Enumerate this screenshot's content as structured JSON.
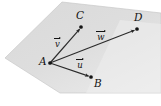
{
  "figure": {
    "kind": "vector-diagram-in-plane",
    "canvas": {
      "width": 106,
      "height": 106
    },
    "colors": {
      "plane_fill": "#dcdcdc",
      "plane_fill_light": "#e9e9e9",
      "plane_stroke": "#c4c4c4",
      "arrow": "#262626",
      "label": "#131313",
      "background": "#ffffff"
    },
    "plane": {
      "name": "plane",
      "vertices": [
        [
          62,
          2
        ],
        [
          161,
          13
        ],
        [
          161,
          93
        ],
        [
          60,
          93
        ],
        [
          5,
          58
        ]
      ]
    },
    "points": [
      {
        "id": "A",
        "label": "A",
        "x": 50,
        "y": 63,
        "label_x": 39,
        "label_y": 57
      },
      {
        "id": "B",
        "label": "B",
        "x": 91,
        "y": 77,
        "label_x": 94,
        "label_y": 79
      },
      {
        "id": "C",
        "label": "C",
        "x": 81,
        "y": 27,
        "label_x": 75,
        "label_y": 11
      },
      {
        "id": "D",
        "label": "D",
        "x": 137,
        "y": 29,
        "label_x": 134,
        "label_y": 13
      }
    ],
    "vectors": [
      {
        "id": "u",
        "glyph": "u",
        "label": "u",
        "from": "A",
        "to": "B",
        "label_x": 76,
        "label_y": 58
      },
      {
        "id": "v",
        "glyph": "v",
        "label": "v",
        "from": "A",
        "to": "C",
        "label_x": 54,
        "label_y": 37
      },
      {
        "id": "w",
        "glyph": "w",
        "label": "w",
        "from": "A",
        "to": "D",
        "label_x": 96,
        "label_y": 30
      }
    ]
  }
}
